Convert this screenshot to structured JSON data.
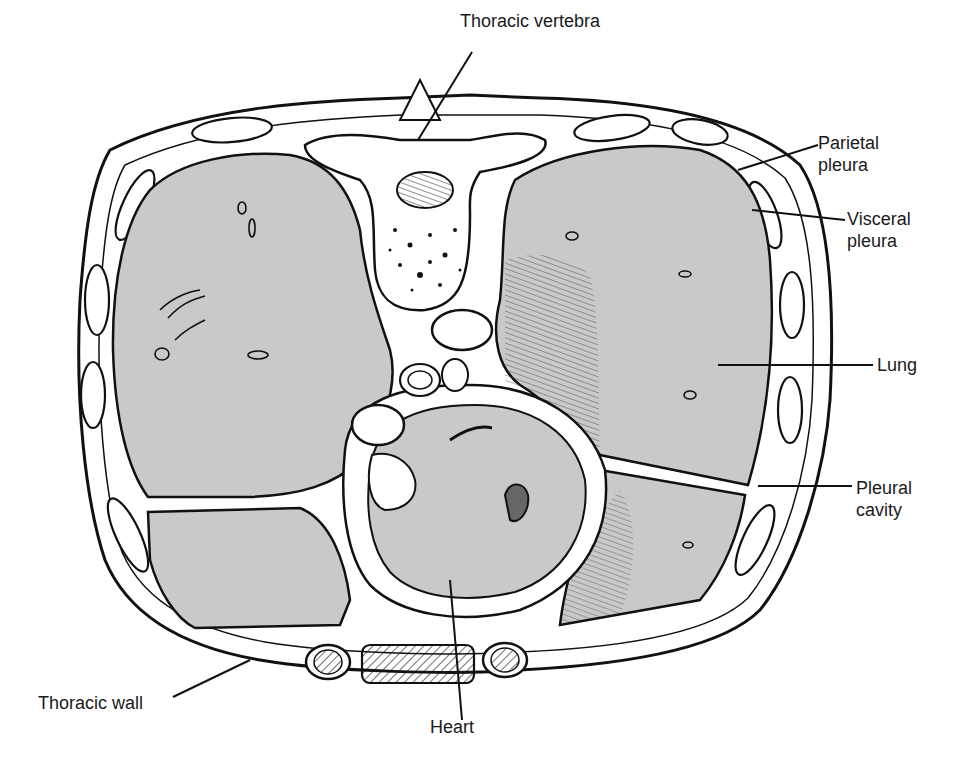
{
  "figure": {
    "colors": {
      "lung_fill": "#c9c9c9",
      "ink": "#111111",
      "background": "#ffffff",
      "tissue": "#ffffff"
    }
  },
  "labels": {
    "thoracic_vertebra": "Thoracic vertebra",
    "parietal_pleura": "Parietal\npleura",
    "visceral_pleura": "Visceral\npleura",
    "lung": "Lung",
    "pleural_cavity": "Pleural\ncavity",
    "thoracic_wall": "Thoracic wall",
    "heart": "Heart"
  }
}
